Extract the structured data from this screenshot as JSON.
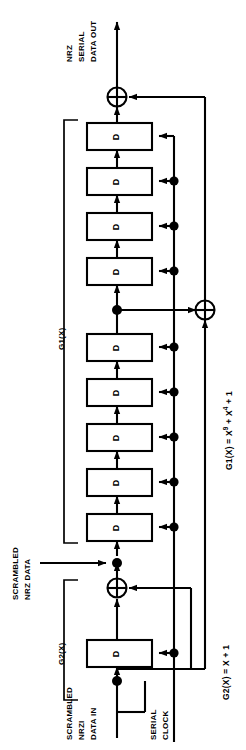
{
  "diagram": {
    "type": "logic-block-diagram",
    "orientation": "rotated-90-ccw",
    "colors": {
      "line": "#000000",
      "background": "#ffffff",
      "fill": "#ffffff"
    },
    "signals": {
      "output": "NRZ\nSERIAL\nDATA OUT",
      "output_lines": [
        "NRZ",
        "SERIAL",
        "DATA OUT"
      ],
      "mid_tap": "SCRAMBLED\nNRZ DATA",
      "mid_tap_lines": [
        "SCRAMBLED",
        "NRZ DATA"
      ],
      "input": "SCRAMBLED\nNRZI\nDATA IN",
      "input_lines": [
        "SCRAMBLED",
        "NRZI",
        "DATA IN"
      ],
      "clock": "SERIAL\nCLOCK",
      "clock_lines": [
        "SERIAL",
        "CLOCK"
      ]
    },
    "groups": [
      {
        "id": "g1",
        "label": "G1(X)",
        "stages": 9
      },
      {
        "id": "g2",
        "label": "G2(X)",
        "stages": 1
      }
    ],
    "equations": [
      {
        "id": "eq-g1",
        "lhs": "G1(X)",
        "op": "=",
        "terms": [
          "X",
          "9",
          "+",
          "X",
          "4",
          "+",
          "1"
        ],
        "text": "G1(X) = X 9 + X 4 + 1"
      },
      {
        "id": "eq-g2",
        "lhs": "G2(X)",
        "op": "=",
        "terms": [
          "X",
          "+",
          "1"
        ],
        "text": "G2(X) = X + 1"
      }
    ],
    "flipflops": [
      {
        "index": 1,
        "letter": "D",
        "group": "g1"
      },
      {
        "index": 2,
        "letter": "D",
        "group": "g1"
      },
      {
        "index": 3,
        "letter": "D",
        "group": "g1"
      },
      {
        "index": 4,
        "letter": "D",
        "group": "g1"
      },
      {
        "index": 5,
        "letter": "D",
        "group": "g1"
      },
      {
        "index": 6,
        "letter": "D",
        "group": "g1"
      },
      {
        "index": 7,
        "letter": "D",
        "group": "g1"
      },
      {
        "index": 8,
        "letter": "D",
        "group": "g1"
      },
      {
        "index": 9,
        "letter": "D",
        "group": "g1"
      },
      {
        "index": 10,
        "letter": "D",
        "group": "g2"
      }
    ],
    "gates": [
      {
        "id": "xor-top",
        "symbol": "xor",
        "glyph": "+"
      },
      {
        "id": "xor-mid",
        "symbol": "xor",
        "glyph": "+"
      },
      {
        "id": "xor-bottom",
        "symbol": "xor",
        "glyph": "+"
      }
    ]
  }
}
